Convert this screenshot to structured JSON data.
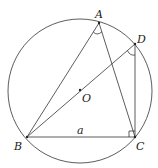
{
  "diagram": {
    "type": "inscribed triangle in circle",
    "circle": {
      "center_label": "O",
      "cx": 80,
      "cy": 91,
      "r": 72
    },
    "points": {
      "A": {
        "label": "A",
        "x": 99,
        "y": 23
      },
      "D": {
        "label": "D",
        "x": 135,
        "y": 44
      },
      "B": {
        "label": "B",
        "x": 27,
        "y": 137
      },
      "C": {
        "label": "C",
        "x": 135,
        "y": 137
      },
      "O": {
        "label": "O",
        "x": 80,
        "y": 90
      }
    },
    "segments": [
      "AB",
      "AC",
      "BD",
      "DC",
      "BC"
    ],
    "side_label": "a",
    "angle_marks": [
      "angle BAC",
      "angle BDC"
    ],
    "right_angle": "angle BCD"
  }
}
